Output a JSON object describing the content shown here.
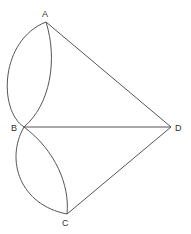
{
  "diagram": {
    "type": "graph",
    "nodes": [
      {
        "id": "A",
        "label": "A",
        "x": 46,
        "y": 22
      },
      {
        "id": "B",
        "label": "B",
        "x": 24,
        "y": 127
      },
      {
        "id": "C",
        "label": "C",
        "x": 67,
        "y": 214
      },
      {
        "id": "D",
        "label": "D",
        "x": 171,
        "y": 127
      }
    ],
    "edges": [
      {
        "from": "A",
        "to": "B",
        "shape": "curve-left"
      },
      {
        "from": "A",
        "to": "B",
        "shape": "curve-right"
      },
      {
        "from": "B",
        "to": "C",
        "shape": "curve-left"
      },
      {
        "from": "B",
        "to": "C",
        "shape": "curve-right"
      },
      {
        "from": "A",
        "to": "D",
        "shape": "straight"
      },
      {
        "from": "B",
        "to": "D",
        "shape": "straight"
      },
      {
        "from": "C",
        "to": "D",
        "shape": "straight"
      }
    ],
    "stroke_color": "#555555"
  }
}
